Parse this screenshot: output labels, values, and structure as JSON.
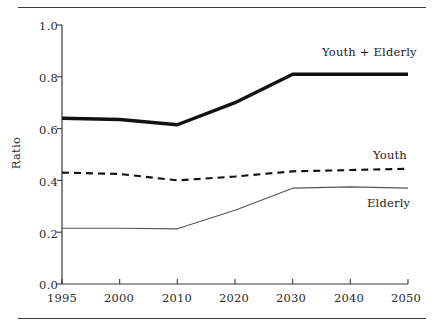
{
  "chart_data": {
    "type": "line",
    "title": "",
    "xlabel": "",
    "ylabel": "Ratio",
    "ylim": [
      0.0,
      1.0
    ],
    "yticks": [
      "0.0",
      "0.2",
      "0.4",
      "0.6",
      "0.8",
      "1.0"
    ],
    "ytick_values": [
      0.0,
      0.2,
      0.4,
      0.6,
      0.8,
      1.0
    ],
    "categories": [
      "1995",
      "2000",
      "2010",
      "2020",
      "2030",
      "2040",
      "2050"
    ],
    "x": [
      1995,
      2000,
      2010,
      2020,
      2030,
      2040,
      2050
    ],
    "x_axis_scale": "categorical-evenly-spaced",
    "grid": false,
    "legend_position": "inline-right-of-series",
    "series": [
      {
        "name": "Youth + Elderly",
        "values": [
          0.64,
          0.635,
          0.615,
          0.7,
          0.81,
          0.81,
          0.81
        ],
        "style": "solid",
        "linewidth": "thick",
        "color": "#111111"
      },
      {
        "name": "Youth",
        "values": [
          0.43,
          0.425,
          0.4,
          0.415,
          0.435,
          0.44,
          0.445
        ],
        "style": "dashed",
        "linewidth": "medium",
        "color": "#111111"
      },
      {
        "name": "Elderly",
        "values": [
          0.215,
          0.215,
          0.213,
          0.285,
          0.37,
          0.375,
          0.37
        ],
        "style": "solid",
        "linewidth": "thin",
        "color": "#555555"
      }
    ]
  },
  "axes": {
    "y_label": "Ratio",
    "y_tick_labels": [
      "1.0",
      "0.8",
      "0.6",
      "0.4",
      "0.2",
      "0.0"
    ],
    "x_tick_labels": [
      "1995",
      "2000",
      "2010",
      "2020",
      "2030",
      "2040",
      "2050"
    ]
  },
  "labels": {
    "total": "Youth + Elderly",
    "youth": "Youth",
    "elderly": "Elderly"
  },
  "colors": {
    "total_line": "#111111",
    "youth_line": "#111111",
    "elderly_line": "#555555",
    "axis": "#3a3a3a",
    "text": "#2b2b2b",
    "background": "#ffffff"
  }
}
